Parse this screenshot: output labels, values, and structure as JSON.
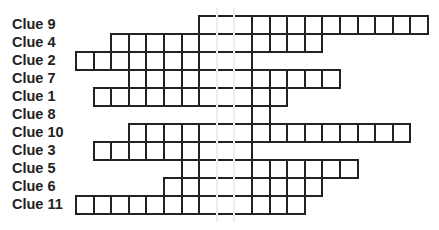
{
  "puzzle": {
    "type": "crossword-ladder",
    "grid": {
      "left": 75,
      "top": 15,
      "cell_w": 17.6,
      "cell_h": 18,
      "highlight_columns": [
        8,
        9
      ]
    },
    "rows": [
      {
        "label": "Clue 9",
        "start": 7,
        "end": 19
      },
      {
        "label": "Clue 4",
        "start": 2,
        "end": 13
      },
      {
        "label": "Clue 2",
        "start": 0,
        "end": 9
      },
      {
        "label": "Clue 7",
        "start": 3,
        "end": 14
      },
      {
        "label": "Clue 1",
        "start": 1,
        "end": 11
      },
      {
        "label": "Clue 8",
        "start": 8,
        "end": 10
      },
      {
        "label": "Clue 10",
        "start": 3,
        "end": 18
      },
      {
        "label": "Clue 3",
        "start": 1,
        "end": 9
      },
      {
        "label": "Clue 5",
        "start": 6,
        "end": 15
      },
      {
        "label": "Clue 6",
        "start": 5,
        "end": 13
      },
      {
        "label": "Clue 11",
        "start": 0,
        "end": 12
      }
    ]
  }
}
